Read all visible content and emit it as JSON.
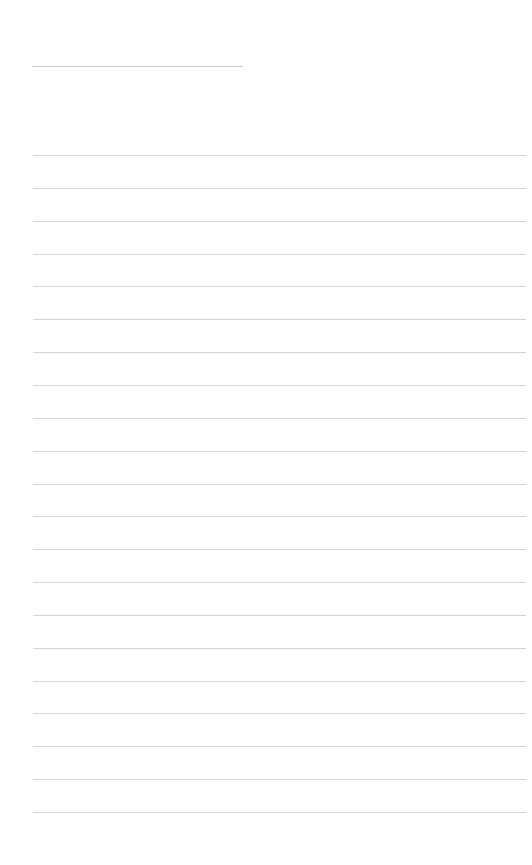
{
  "page": {
    "background": "#ffffff",
    "line_color": "#d4d4d4",
    "title_line": {
      "x1": 32,
      "x2": 243,
      "y": 66,
      "color": "#c8c8c8"
    },
    "ruled_lines": {
      "count": 21,
      "x1": 33,
      "x2": 526,
      "first_y": 155,
      "spacing": 32.85
    }
  }
}
